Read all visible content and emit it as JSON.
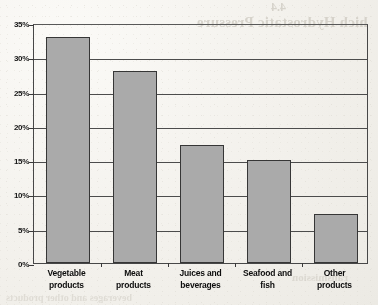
{
  "chart_data": {
    "type": "bar",
    "title": "",
    "xlabel": "",
    "ylabel": "",
    "categories": [
      "Vegetable products",
      "Meat products",
      "Juices and beverages",
      "Seafood and fish",
      "Other products"
    ],
    "category_lines": [
      [
        "Vegetable",
        "products"
      ],
      [
        "Meat",
        "products"
      ],
      [
        "Juices and",
        "beverages"
      ],
      [
        "Seafood and",
        "fish"
      ],
      [
        "Other",
        "products"
      ]
    ],
    "values": [
      33,
      28,
      17.2,
      15,
      7.2
    ],
    "value_labels": [
      "33%",
      "28%",
      "17%",
      "15%",
      "7%"
    ],
    "ylim": [
      0,
      35
    ],
    "ytick_values": [
      0,
      5,
      10,
      15,
      20,
      25,
      30,
      35
    ],
    "ytick_labels": [
      "0%",
      "5%",
      "10%",
      "15%",
      "20%",
      "25%",
      "30%",
      "35%"
    ],
    "grid": true,
    "legend": false,
    "legend_position": "none",
    "bar_color": "#a8a8a8",
    "bar_border_color": "#3a3a3a",
    "axis_color": "#4a4a4a",
    "background_color": "#f4f2ee"
  },
  "artifacts": {
    "bleed_title": "hich Hydrostatic Pressure",
    "bleed_sub": "4.4",
    "bleed_low": "ransmission",
    "bleed_lower": "beverages and other products"
  }
}
